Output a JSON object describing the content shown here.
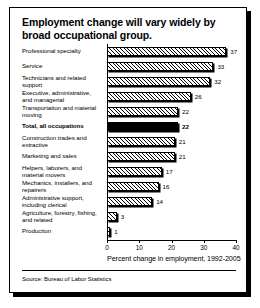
{
  "figure": {
    "title": "Employment change will vary widely by broad occupational group.",
    "source": "Source: Bureau of Labor Statistics"
  },
  "chart_data": {
    "type": "bar",
    "orientation": "horizontal",
    "title": "Employment change will vary widely by broad occupational group.",
    "xlabel": "Percent change in employment, 1992-2005",
    "ylabel": "",
    "xlim": [
      0,
      40
    ],
    "xticks": [
      0,
      10,
      20,
      30,
      40
    ],
    "xtick_labels": [
      "0",
      "10",
      "20",
      "30",
      "40"
    ],
    "grid": false,
    "legend": null,
    "categories": [
      "Professional specialty",
      "Service",
      "Technicians and related support",
      "Executive, administrative, and managerial",
      "Transportation and material moving",
      "Total, all occupations",
      "Construction trades and extractive",
      "Marketing and sales",
      "Helpers, laborers, and material movers",
      "Mechanics, installers, and repairers",
      "Administrative support, including clerical",
      "Agriculture, forestry, fishing, and related",
      "Production"
    ],
    "values": [
      37,
      33,
      32,
      26,
      22,
      22,
      21,
      21,
      17,
      16,
      14,
      3,
      1
    ],
    "highlight_index": 5,
    "bars": [
      {
        "label": "Professional specialty",
        "label_lines": [
          "Professional specialty"
        ],
        "value": 37,
        "value_text": "37",
        "highlight": false
      },
      {
        "label": "Service",
        "label_lines": [
          "Service"
        ],
        "value": 33,
        "value_text": "33",
        "highlight": false
      },
      {
        "label": "Technicians and related support",
        "label_lines": [
          "Technicians and related",
          "support"
        ],
        "value": 32,
        "value_text": "32",
        "highlight": false
      },
      {
        "label": "Executive, administrative, and managerial",
        "label_lines": [
          "Executive, administrative,",
          "and managerial"
        ],
        "value": 26,
        "value_text": "26",
        "highlight": false
      },
      {
        "label": "Transportation and material moving",
        "label_lines": [
          "Transportation and material",
          "moving"
        ],
        "value": 22,
        "value_text": "22",
        "highlight": false
      },
      {
        "label": "Total, all occupations",
        "label_lines": [
          "Total, all occupations"
        ],
        "value": 22,
        "value_text": "22",
        "highlight": true
      },
      {
        "label": "Construction trades and extractive",
        "label_lines": [
          "Construction trades and",
          "extractive"
        ],
        "value": 21,
        "value_text": "21",
        "highlight": false
      },
      {
        "label": "Marketing and sales",
        "label_lines": [
          "Marketing and sales"
        ],
        "value": 21,
        "value_text": "21",
        "highlight": false
      },
      {
        "label": "Helpers, laborers, and material movers",
        "label_lines": [
          "Helpers, laborers, and",
          "material movers"
        ],
        "value": 17,
        "value_text": "17",
        "highlight": false
      },
      {
        "label": "Mechanics, installers, and repairers",
        "label_lines": [
          "Mechanics, installers, and",
          "repairers"
        ],
        "value": 16,
        "value_text": "16",
        "highlight": false
      },
      {
        "label": "Administrative support, including clerical",
        "label_lines": [
          "Administrative support,",
          "including clerical"
        ],
        "value": 14,
        "value_text": "14",
        "highlight": false
      },
      {
        "label": "Agriculture, forestry, fishing, and related",
        "label_lines": [
          "Agriculture, forestry, fishing,",
          "and related"
        ],
        "value": 3,
        "value_text": "3",
        "highlight": false
      },
      {
        "label": "Production",
        "label_lines": [
          "Production"
        ],
        "value": 1,
        "value_text": "1",
        "highlight": false
      }
    ]
  }
}
